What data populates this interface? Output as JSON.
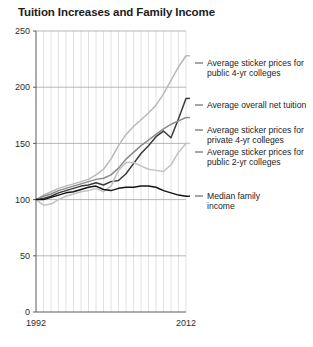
{
  "title": "Tuition Increases and Family Income",
  "axis": {
    "y_ticks": [
      "0",
      "50",
      "100",
      "150",
      "200",
      "250"
    ],
    "x_ticks": [
      "1992",
      "2012"
    ],
    "y_min": 0,
    "y_max": 250,
    "x_min": 1992,
    "x_max": 2012
  },
  "labels": {
    "public4": {
      "line1": "Average sticker prices for",
      "line2": "public 4-yr colleges"
    },
    "net": {
      "line1": "Average overall net tuition",
      "line2": ""
    },
    "private4": {
      "line1": "Average sticker prices for",
      "line2": "private 4-yr colleges"
    },
    "public2": {
      "line1": "Average sticker prices for",
      "line2": "public 2-yr colleges"
    },
    "income": {
      "line1": "Median family",
      "line2": "income"
    }
  },
  "colors": {
    "public4": "#b9b9b9",
    "net": "#3a3a3a",
    "private4": "#8a8a8a",
    "public2": "#c2c2c2",
    "income": "#141414",
    "grid": "#e2e2e2",
    "axis": "#5a5a5a",
    "frame": "#8c8c8c"
  },
  "chart_data": {
    "type": "line",
    "title": "Tuition Increases and Family Income",
    "xlabel": "",
    "ylabel": "",
    "xlim": [
      1992,
      2012
    ],
    "ylim": [
      0,
      250
    ],
    "grid": true,
    "legend": "right-inline-labels",
    "x": [
      1992,
      1993,
      1994,
      1995,
      1996,
      1997,
      1998,
      1999,
      2000,
      2001,
      2002,
      2003,
      2004,
      2005,
      2006,
      2007,
      2008,
      2009,
      2010,
      2011,
      2012
    ],
    "series": [
      {
        "name": "Average sticker prices for public 4-yr colleges",
        "color": "#b9b9b9",
        "values": [
          100,
          104,
          107,
          110,
          112,
          114,
          116,
          118,
          122,
          127,
          136,
          148,
          158,
          165,
          171,
          177,
          184,
          194,
          206,
          218,
          228
        ]
      },
      {
        "name": "Average overall net tuition",
        "color": "#3a3a3a",
        "values": [
          100,
          101,
          103,
          106,
          108,
          110,
          112,
          113,
          115,
          113,
          116,
          117,
          123,
          132,
          141,
          148,
          156,
          161,
          155,
          172,
          190
        ]
      },
      {
        "name": "Average sticker prices for private 4-yr colleges",
        "color": "#8a8a8a",
        "values": [
          100,
          103,
          105,
          108,
          110,
          112,
          114,
          116,
          118,
          119,
          122,
          128,
          136,
          142,
          148,
          153,
          158,
          163,
          167,
          170,
          173
        ]
      },
      {
        "name": "Average sticker prices for public 2-yr colleges",
        "color": "#c2c2c2",
        "values": [
          100,
          95,
          96,
          100,
          103,
          105,
          107,
          108,
          110,
          107,
          112,
          126,
          133,
          133,
          130,
          127,
          126,
          125,
          131,
          142,
          150
        ]
      },
      {
        "name": "Median family income",
        "color": "#141414",
        "values": [
          100,
          100,
          102,
          104,
          106,
          107,
          109,
          111,
          112,
          109,
          108,
          110,
          111,
          111,
          112,
          112,
          111,
          108,
          106,
          104,
          103
        ]
      }
    ]
  }
}
